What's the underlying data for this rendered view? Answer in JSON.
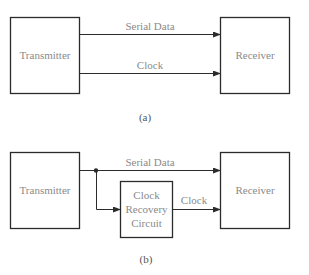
{
  "diagram_a": {
    "caption": "(a)",
    "transmitter_label": "Transmitter",
    "receiver_label": "Receiver",
    "signals": [
      {
        "label": "Serial Data"
      },
      {
        "label": "Clock"
      }
    ]
  },
  "diagram_b": {
    "caption": "(b)",
    "transmitter_label": "Transmitter",
    "receiver_label": "Receiver",
    "serial_data_label": "Serial Data",
    "clock_label": "Clock",
    "clock_recovery": {
      "line1": "Clock",
      "line2": "Recovery",
      "line3": "Circuit"
    }
  },
  "colors": {
    "stroke": "#2b2b2b",
    "text": "#8a8a8a"
  }
}
